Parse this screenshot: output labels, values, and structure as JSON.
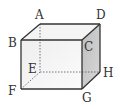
{
  "diagram": {
    "type": "cube",
    "vertices": {
      "A": {
        "label": "A",
        "x": 40,
        "y": 24,
        "lx": 35,
        "ly": 19
      },
      "B": {
        "label": "B",
        "x": 21,
        "y": 40,
        "lx": 8,
        "ly": 47
      },
      "C": {
        "label": "C",
        "x": 82,
        "y": 40,
        "lx": 84,
        "ly": 51
      },
      "D": {
        "label": "D",
        "x": 100,
        "y": 24,
        "lx": 96,
        "ly": 19
      },
      "E": {
        "label": "E",
        "x": 40,
        "y": 72,
        "lx": 28,
        "ly": 73
      },
      "F": {
        "label": "F",
        "x": 21,
        "y": 89,
        "lx": 8,
        "ly": 95
      },
      "G": {
        "label": "G",
        "x": 82,
        "y": 89,
        "lx": 82,
        "ly": 102
      },
      "H": {
        "label": "H",
        "x": 100,
        "y": 72,
        "lx": 103,
        "ly": 77
      }
    },
    "hidden_edges": [
      "AE",
      "EF",
      "EH"
    ],
    "colors": {
      "edge": "#333333",
      "front_face_top": "#f0f0f0",
      "front_face_bottom": "#fafafa",
      "right_face": "#c8c8c8",
      "top_face": "#f4f4f4"
    }
  }
}
